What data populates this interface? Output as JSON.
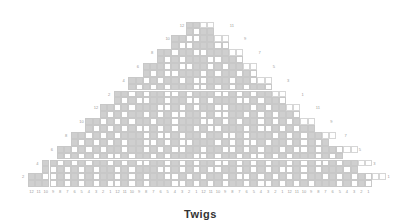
{
  "title": "Twigs",
  "chart_data": {
    "type": "table",
    "title": "Twigs",
    "grid": {
      "columns": 48,
      "rows": 24,
      "cell_w": 7.17,
      "cell_h": 6.9,
      "origin_x": 28,
      "origin_y": 21.5
    },
    "colors": {
      "filled": "#cfcfcf",
      "empty": "#ffffff",
      "grid_line": "#c8c8c8",
      "label": "#9a9a9a",
      "title": "#333333"
    },
    "column_labels": [
      "12",
      "11",
      "10",
      "9",
      "8",
      "7",
      "6",
      "5",
      "4",
      "3",
      "2",
      "1",
      "12",
      "11",
      "10",
      "9",
      "8",
      "7",
      "6",
      "5",
      "4",
      "3",
      "2",
      "1",
      "12",
      "11",
      "10",
      "9",
      "8",
      "7",
      "6",
      "5",
      "4",
      "3",
      "2",
      "1",
      "12",
      "11",
      "10",
      "9",
      "8",
      "7",
      "6",
      "5",
      "4",
      "3",
      "2",
      "1"
    ],
    "left_row_labels": [
      {
        "row": 0,
        "label": "12"
      },
      {
        "row": 2,
        "label": "10"
      },
      {
        "row": 4,
        "label": "8"
      },
      {
        "row": 6,
        "label": "6"
      },
      {
        "row": 8,
        "label": "4"
      },
      {
        "row": 10,
        "label": "2"
      },
      {
        "row": 12,
        "label": "12"
      },
      {
        "row": 14,
        "label": "10"
      },
      {
        "row": 16,
        "label": "8"
      },
      {
        "row": 18,
        "label": "6"
      },
      {
        "row": 20,
        "label": "4"
      },
      {
        "row": 22,
        "label": "2"
      }
    ],
    "right_row_labels": [
      {
        "row": 1,
        "label": "11"
      },
      {
        "row": 3,
        "label": "9"
      },
      {
        "row": 5,
        "label": "7"
      },
      {
        "row": 7,
        "label": "5"
      },
      {
        "row": 9,
        "label": "3"
      },
      {
        "row": 11,
        "label": "1"
      },
      {
        "row": 13,
        "label": "11"
      },
      {
        "row": 15,
        "label": "9"
      },
      {
        "row": 17,
        "label": "7"
      },
      {
        "row": 19,
        "label": "5"
      },
      {
        "row": 21,
        "label": "3"
      },
      {
        "row": 23,
        "label": "1"
      }
    ],
    "rows_top_to_bottom": [
      "......................ggoo......................",
      "......................gwgg......................",
      "....................ggwwggoo....................",
      "....................gwwgggww....................",
      "..................ggwggwwgggoo..................",
      "..................gwgwgggwwggw..................",
      "................gggwgwwggwgwggoo................",
      "................gwgwwgggwgwggwgw................",
      "..............ggwgwggwgwwgggwggwoo..............",
      "..............gwgwgwgggwwgwgwgwggw..............",
      "............ggwgwggwwgwgggwwgwgwggoo............",
      "............gwgwwggwggwwgwgggwwgwggw............",
      "..........ggwgwgggwwgwgwggwwgggwgwggoo..........",
      "..........gwgwggwgwgwwggwgwwggwgwgwggw..........",
      "........ggwgwgwggwggwgggwwgwgwggwgwgwgoo........",
      "........gwgwgwgwwgwgwggwgwwgggwgwwgwgwgg........",
      "......ggwgwgwgggwgwwgwggwggwwgwgggwgwgwggoo.....",
      "......gwgwgwgwggwwgwgwwgggwgwgwwgwggwgwgwggw......",
      "....ggwgwgwggwggwgwgwwggwggwwgwgwggwgwwgwggwoo....",
      "....gwgwgwgwwgwggwgwgggwwgwggwgwwgwgwgggwgwgwg....",
      "..ggwgwgwggwgwgwwggwgwgwggwwgwgwgwggwgwgwwgwggoo..",
      "..gwgwgwgwggwgwgggwwgwgwgwwggwgwgwgwwgwgwgggwgwg..",
      "ggwwgwgwgwggwgwgwggwwgwgwggwgwwgwgwgwgwggwgwgwgwoo",
      "gggwgwgwgwgwwgwgwgggwwgwgwgwggwgwwgwgwgwgggwgwgw.."
    ]
  }
}
